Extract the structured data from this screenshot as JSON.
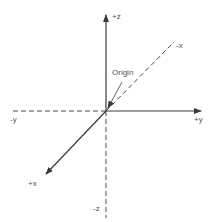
{
  "diagram": {
    "title": "",
    "colors": {
      "axis": "#3a3a3a",
      "dashed": "#4a4a4a",
      "text": "#555555",
      "background": "#ffffff"
    },
    "origin": {
      "label": "Origin",
      "x": 106,
      "y": 111
    },
    "axes": [
      {
        "id": "pos-z",
        "label": "+z",
        "style": "solid",
        "arrow": true,
        "end": [
          106,
          14
        ]
      },
      {
        "id": "neg-z",
        "label": "-z",
        "style": "dashed",
        "arrow": false,
        "end": [
          106,
          218
        ]
      },
      {
        "id": "pos-y",
        "label": "+y",
        "style": "solid",
        "arrow": true,
        "end": [
          202,
          111
        ]
      },
      {
        "id": "neg-y",
        "label": "-y",
        "style": "dashed",
        "arrow": false,
        "end": [
          12,
          111
        ]
      },
      {
        "id": "pos-x",
        "label": "+x",
        "style": "solid",
        "arrow": true,
        "end": [
          45,
          175
        ]
      },
      {
        "id": "neg-x",
        "label": "-x",
        "style": "dashed",
        "arrow": false,
        "end": [
          174,
          42
        ]
      }
    ]
  }
}
